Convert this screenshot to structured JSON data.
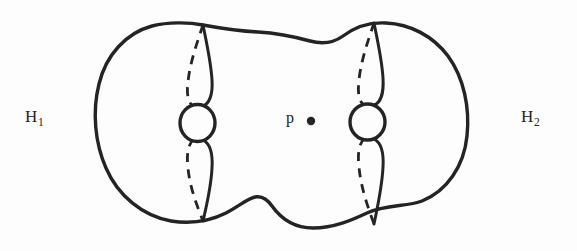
{
  "figure": {
    "kind": "topology-diagram",
    "background_color": "#fdfdfd",
    "ink_color": "#242424",
    "stroke_width_px": 3,
    "width": 577,
    "height": 251
  },
  "labels": {
    "left_handlebody": {
      "base": "H",
      "subscript": "1",
      "text": "H1"
    },
    "right_handlebody": {
      "base": "H",
      "subscript": "2",
      "text": "H2"
    },
    "point": {
      "text": "p"
    }
  },
  "markers": {
    "point_p": {
      "cx": 311,
      "cy": 121,
      "r": 4.2,
      "fill": "#242424"
    }
  },
  "geometry": {
    "outline_path": "M 203 25 C 188 22 168 22 152 26 C 126 33 106 55 99 84 C 92 112 95 143 106 168 C 118 196 143 216 171 221 C 190 224 210 221 226 213 C 246 203 258 186 272 206 C 282 220 296 228 313 228 C 334 228 352 220 367 213 C 386 204 407 207 422 201 C 447 191 464 166 467 136 C 470 108 464 78 448 56 C 433 36 410 24 386 23 C 370 22 355 27 343 36 C 332 44 321 44 310 41 C 292 36 276 33 258 32 C 238 31 219 28 203 25 Z",
    "top_waist_note": "dips from cusp y=25 down to about y=42 at x=290 then rises to cusp y=23",
    "bottom_waist_note": "rises from cusp y=221 up to about y=206 at x=290 then falls to cusp y=228",
    "handles": [
      {
        "name": "left-handle-circle",
        "cx": 197.5,
        "cy": 123,
        "rx": 17.5,
        "ry": 18.5
      },
      {
        "name": "right-handle-circle",
        "cx": 367.5,
        "cy": 122,
        "rx": 17.5,
        "ry": 18
      }
    ],
    "meridians": [
      {
        "name": "left-front-upper",
        "style": "solid",
        "path": "M 203 25 C 206 40 211 62 212 80 C 213 95 209 104 203 106"
      },
      {
        "name": "left-back-upper",
        "style": "dashed",
        "path": "M 203 25 C 198 40 190 62 188 82 C 186 96 189 104 194 107"
      },
      {
        "name": "left-front-lower",
        "style": "solid",
        "path": "M 203 140 C 209 143 213 152 212 168 C 211 188 206 208 203 221"
      },
      {
        "name": "left-back-lower",
        "style": "dashed",
        "path": "M 194 139 C 189 143 186 152 188 168 C 190 189 198 208 203 221"
      },
      {
        "name": "right-front-upper",
        "style": "solid",
        "path": "M 374 23 C 377 38 382 60 383 78 C 384 94 380 103 374 105"
      },
      {
        "name": "right-back-upper",
        "style": "dashed",
        "path": "M 374 23 C 369 38 361 60 359 80 C 357 95 360 103 365 106"
      },
      {
        "name": "right-front-lower",
        "style": "solid",
        "path": "M 374 139 C 380 142 384 151 383 167 C 382 188 377 209 374 224"
      },
      {
        "name": "right-back-lower",
        "style": "dashed",
        "path": "M 365 138 C 360 142 357 151 359 167 C 361 189 369 210 374 224"
      }
    ],
    "dash_pattern": "9 7"
  }
}
